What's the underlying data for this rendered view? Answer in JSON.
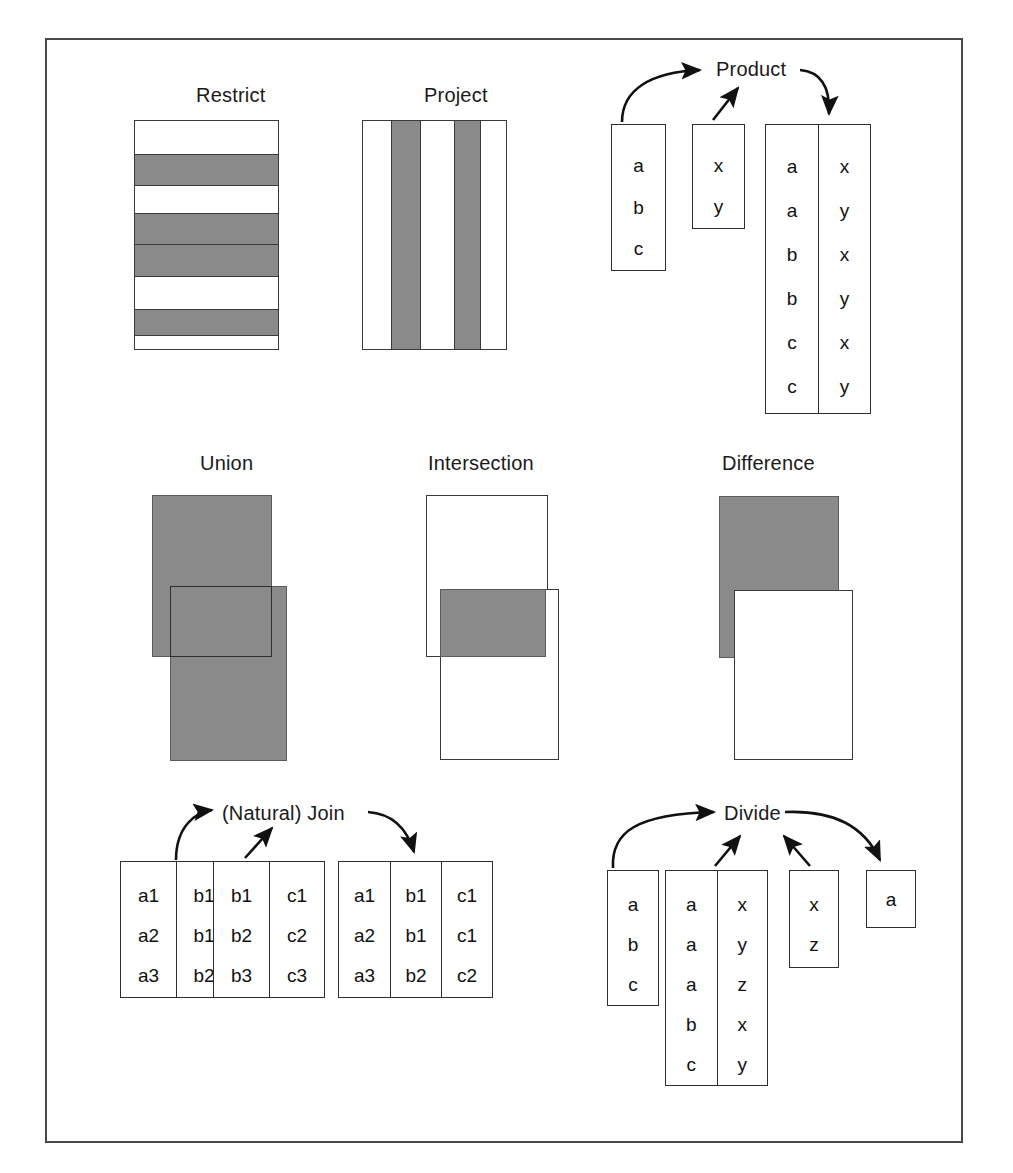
{
  "figure": {
    "caption": "",
    "colors": {
      "fill_gray": "#8a8a8a",
      "outline": "#3a3a3a",
      "frame": "#4a4a4a",
      "text": "#111111",
      "page": "#ffffff"
    }
  },
  "operations": {
    "restrict": {
      "title": "Restrict",
      "kind": "horizontal-bands",
      "bands": [
        "white",
        "gray",
        "white",
        "gray",
        "gray",
        "white",
        "gray",
        "white"
      ]
    },
    "project": {
      "title": "Project",
      "kind": "vertical-columns",
      "columns": [
        "white",
        "gray",
        "white",
        "gray",
        "white"
      ]
    },
    "product": {
      "title": "Product",
      "inputs": [
        {
          "name": "left-relation",
          "columns": [
            [
              "a",
              "b",
              "c"
            ]
          ]
        },
        {
          "name": "right-relation",
          "columns": [
            [
              "x",
              "y"
            ]
          ]
        }
      ],
      "output": {
        "name": "product-result",
        "columns": [
          [
            "a",
            "a",
            "b",
            "b",
            "c",
            "c"
          ],
          [
            "x",
            "y",
            "x",
            "y",
            "x",
            "y"
          ]
        ]
      }
    },
    "union": {
      "title": "Union",
      "shapes": [
        {
          "name": "set-a",
          "fill": "gray"
        },
        {
          "name": "set-b",
          "fill": "gray"
        }
      ]
    },
    "intersection": {
      "title": "Intersection",
      "shapes": [
        {
          "name": "set-a",
          "fill": "white"
        },
        {
          "name": "set-b",
          "fill": "white"
        },
        {
          "name": "overlap",
          "fill": "gray"
        }
      ]
    },
    "difference": {
      "title": "Difference",
      "shapes": [
        {
          "name": "set-a",
          "fill": "gray"
        },
        {
          "name": "set-b",
          "fill": "white"
        }
      ]
    },
    "join": {
      "title": "(Natural) Join",
      "inputs": [
        {
          "name": "left-relation",
          "columns": [
            [
              "a1",
              "a2",
              "a3"
            ],
            [
              "b1",
              "b1",
              "b2"
            ]
          ]
        },
        {
          "name": "right-relation",
          "columns": [
            [
              "b1",
              "b2",
              "b3"
            ],
            [
              "c1",
              "c2",
              "c3"
            ]
          ]
        }
      ],
      "output": {
        "name": "join-result",
        "columns": [
          [
            "a1",
            "a2",
            "a3"
          ],
          [
            "b1",
            "b1",
            "b2"
          ],
          [
            "c1",
            "c1",
            "c2"
          ]
        ]
      }
    },
    "divide": {
      "title": "Divide",
      "inputs": [
        {
          "name": "dividend-left",
          "columns": [
            [
              "a",
              "b",
              "c"
            ]
          ]
        },
        {
          "name": "dividend-pairs",
          "columns": [
            [
              "a",
              "a",
              "a",
              "b",
              "c"
            ],
            [
              "x",
              "y",
              "z",
              "x",
              "y"
            ]
          ]
        },
        {
          "name": "divisor",
          "columns": [
            [
              "x",
              "z"
            ]
          ]
        }
      ],
      "output": {
        "name": "divide-result",
        "columns": [
          [
            "a"
          ]
        ]
      }
    }
  }
}
